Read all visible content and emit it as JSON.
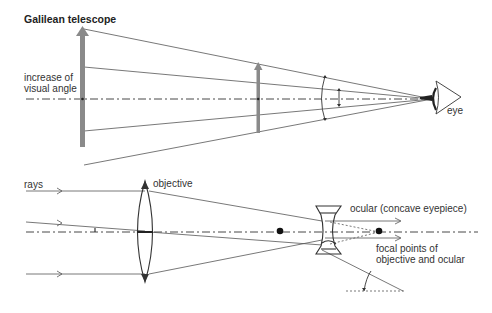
{
  "title": "Galilean telescope",
  "labels": {
    "visual_angle_line1": "increase of",
    "visual_angle_line2": "visual angle",
    "eye": "eye",
    "rays": "rays",
    "objective": "objective",
    "ocular": "ocular (concave eyepiece)",
    "focal_line1": "focal points of",
    "focal_line2": "objective and ocular"
  },
  "colors": {
    "line": "#555555",
    "arrow_fill": "#8a8a8a",
    "text": "#333333",
    "background": "#ffffff"
  },
  "top_diagram": {
    "axis_y": 99,
    "large_object_arrow": {
      "x": 82,
      "top": 28,
      "bottom": 147
    },
    "small_object_arrow": {
      "x": 258,
      "top": 63,
      "bottom": 133
    },
    "eye": {
      "x": 437,
      "y": 98
    }
  },
  "bottom_diagram": {
    "axis_y": 232,
    "objective_lens": {
      "x": 145,
      "top": 181,
      "bottom": 282
    },
    "ocular_lens": {
      "x": 322,
      "top": 206,
      "bottom": 254
    },
    "focal_points_x": [
      280,
      379
    ]
  }
}
